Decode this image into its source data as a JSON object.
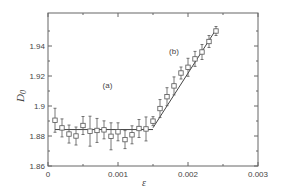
{
  "chart_data": {
    "type": "scatter",
    "title": "",
    "xlabel": "ε",
    "ylabel": "D_0",
    "xlim": [
      0,
      0.003
    ],
    "ylim": [
      1.86,
      1.96
    ],
    "xticks": [
      "0",
      "0.001",
      "0.002",
      "0.003"
    ],
    "yticks": [
      "1.86",
      "1.88",
      "1.9",
      "1.92",
      "1.94"
    ],
    "grid": false,
    "annotations": [
      {
        "text": "(a)",
        "x": 0.00085,
        "y": 1.912
      },
      {
        "text": "(b)",
        "x": 0.0018,
        "y": 1.935
      }
    ],
    "series": [
      {
        "name": "data",
        "marker": "open-square",
        "x": [
          0.0001,
          0.0002,
          0.0003,
          0.0004,
          0.0005,
          0.0006,
          0.0007,
          0.0008,
          0.0009,
          0.001,
          0.0011,
          0.0012,
          0.0013,
          0.0014,
          0.0015,
          0.0016,
          0.0017,
          0.0018,
          0.0019,
          0.002,
          0.0021,
          0.0022,
          0.0023,
          0.0024
        ],
        "y": [
          1.8905,
          1.8854,
          1.8813,
          1.88,
          1.887,
          1.8832,
          1.8837,
          1.8841,
          1.8798,
          1.8828,
          1.8776,
          1.8808,
          1.885,
          1.8847,
          1.8899,
          1.8983,
          1.9062,
          1.9134,
          1.922,
          1.9258,
          1.9314,
          1.936,
          1.943,
          1.95
        ],
        "err": [
          0.008,
          0.006,
          0.006,
          0.006,
          0.006,
          0.01,
          0.008,
          0.006,
          0.009,
          0.006,
          0.006,
          0.006,
          0.006,
          0.008,
          0.003,
          0.006,
          0.006,
          0.006,
          0.004,
          0.006,
          0.005,
          0.005,
          0.004,
          0.003
        ]
      },
      {
        "name": "fit (a)",
        "type": "line",
        "x": [
          0.0001,
          0.0015
        ],
        "y": [
          1.8843,
          1.8843
        ]
      },
      {
        "name": "fit (b)",
        "type": "line",
        "x": [
          0.0015,
          0.0024
        ],
        "y": [
          1.8855,
          1.951
        ]
      }
    ]
  }
}
